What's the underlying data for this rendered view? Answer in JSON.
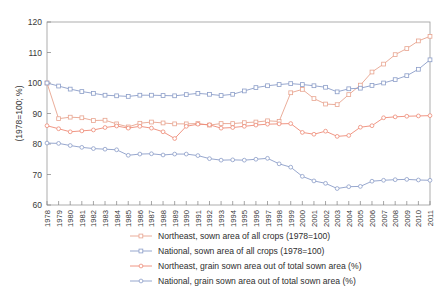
{
  "chart_data": {
    "type": "line",
    "title": "",
    "xlabel": "",
    "ylabel": "(1978=100; %)",
    "ylim": [
      60,
      120
    ],
    "yticks": [
      60,
      70,
      80,
      90,
      100,
      110,
      120
    ],
    "grid": false,
    "legend_position": "below-axis",
    "x": [
      1978,
      1979,
      1980,
      1981,
      1982,
      1983,
      1984,
      1985,
      1986,
      1987,
      1988,
      1989,
      1990,
      1991,
      1992,
      1993,
      1994,
      1995,
      1996,
      1997,
      1998,
      1999,
      2000,
      2001,
      2002,
      2003,
      2004,
      2005,
      2006,
      2007,
      2008,
      2009,
      2010,
      2011
    ],
    "categories": [
      "1978",
      "1979",
      "1980",
      "1981",
      "1982",
      "1983",
      "1984",
      "1985",
      "1986",
      "1987",
      "1988",
      "1989",
      "1990",
      "1991",
      "1992",
      "1993",
      "1994",
      "1995",
      "1996",
      "1997",
      "1998",
      "1999",
      "2000",
      "2001",
      "2002",
      "2003",
      "2004",
      "2005",
      "2006",
      "2007",
      "2008",
      "2009",
      "2010",
      "2011"
    ],
    "series": [
      {
        "name": "Northeast, sown area of all crops (1978=100)",
        "color": "#e8a48f",
        "marker": "square",
        "values": [
          100.0,
          88.3,
          88.8,
          88.6,
          87.7,
          87.8,
          86.6,
          85.6,
          86.8,
          87.2,
          86.9,
          86.6,
          86.6,
          86.7,
          86.2,
          86.7,
          86.7,
          87.0,
          87.2,
          87.6,
          87.4,
          96.8,
          97.9,
          94.9,
          93.1,
          92.9,
          96.2,
          99.3,
          103.6,
          106.2,
          109.3,
          111.3,
          113.8,
          115.3
        ]
      },
      {
        "name": "National, sown area of all crops (1978=100)",
        "color": "#8b9dc8",
        "marker": "square",
        "values": [
          100.0,
          99.0,
          98.0,
          97.2,
          96.6,
          96.0,
          95.8,
          95.6,
          96.0,
          96.0,
          95.9,
          95.8,
          96.2,
          96.6,
          96.3,
          95.9,
          96.3,
          97.4,
          98.5,
          99.1,
          99.5,
          99.8,
          99.5,
          99.1,
          98.6,
          97.1,
          98.1,
          98.3,
          99.2,
          100.0,
          101.1,
          102.4,
          104.5,
          107.6
        ]
      },
      {
        "name": "Northeast, grain sown area out of total sown area (%)",
        "color": "#ee8a76",
        "marker": "circle",
        "values": [
          86.0,
          85.0,
          84.0,
          84.3,
          84.6,
          85.4,
          85.9,
          85.2,
          85.8,
          85.2,
          84.0,
          81.8,
          85.8,
          86.5,
          86.3,
          85.2,
          85.4,
          85.8,
          86.2,
          86.5,
          86.6,
          86.7,
          83.8,
          83.2,
          84.2,
          82.5,
          82.8,
          85.5,
          86.0,
          88.6,
          88.9,
          89.1,
          89.2,
          89.3
        ]
      },
      {
        "name": "National, grain sown area out of total sown area (%)",
        "color": "#8b9dc8",
        "marker": "circle",
        "values": [
          80.3,
          80.2,
          79.5,
          78.9,
          78.5,
          78.3,
          78.1,
          76.3,
          76.7,
          76.8,
          76.4,
          76.7,
          76.7,
          76.2,
          75.2,
          74.7,
          74.8,
          74.7,
          75.0,
          75.3,
          73.5,
          72.4,
          69.4,
          67.9,
          67.1,
          65.4,
          66.0,
          66.1,
          67.8,
          68.1,
          68.3,
          68.4,
          68.2,
          68.1
        ]
      }
    ]
  },
  "axis": {
    "y_title": "(1978=100; %)",
    "y_ticks": [
      "120",
      "110",
      "100",
      "90",
      "80",
      "70",
      "60"
    ]
  },
  "legend": {
    "items": [
      {
        "label": "Northeast, sown area of all crops (1978=100)",
        "color": "#e8a48f",
        "marker": "square"
      },
      {
        "label": "National, sown area of all crops (1978=100)",
        "color": "#8b9dc8",
        "marker": "square"
      },
      {
        "label": "Northeast, grain sown area out of total sown area (%)",
        "color": "#ee8a76",
        "marker": "circle"
      },
      {
        "label": "National, grain sown area out of total sown area (%)",
        "color": "#8b9dc8",
        "marker": "circle"
      }
    ]
  }
}
